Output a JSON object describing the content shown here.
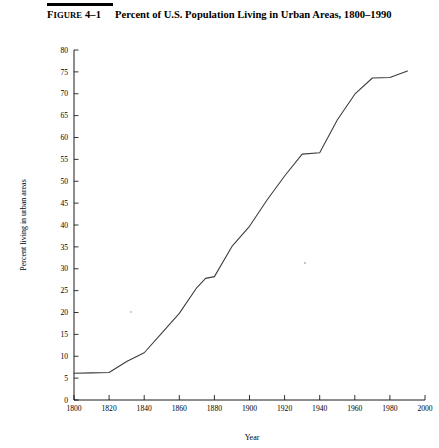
{
  "figure": {
    "label_small_caps": "IGURE",
    "label_lead": "F",
    "label_number": "4–1",
    "title": "Percent of U.S. Population Living in Urban Areas, 1800–1990"
  },
  "chart_data": {
    "type": "line",
    "title": "Percent of U.S. Population Living in Urban Areas, 1800–1990",
    "xlabel": "Year",
    "ylabel": "Percent living in urban areas",
    "xlim": [
      1800,
      2000
    ],
    "ylim": [
      0,
      80
    ],
    "xticks": [
      1800,
      1820,
      1840,
      1860,
      1880,
      1900,
      1920,
      1940,
      1960,
      1980,
      2000
    ],
    "yticks": [
      0,
      5,
      10,
      15,
      20,
      25,
      30,
      35,
      40,
      45,
      50,
      55,
      60,
      65,
      70,
      75,
      80
    ],
    "grid": false,
    "legend": "none",
    "line_color": "#3a3a3a",
    "x": [
      1800,
      1810,
      1820,
      1830,
      1840,
      1850,
      1860,
      1870,
      1875,
      1880,
      1890,
      1900,
      1910,
      1920,
      1930,
      1940,
      1950,
      1960,
      1970,
      1980,
      1990
    ],
    "values": [
      6.1,
      6.2,
      6.3,
      8.8,
      10.8,
      15.3,
      19.8,
      25.7,
      27.8,
      28.2,
      35.1,
      39.7,
      45.7,
      51.2,
      56.2,
      56.5,
      64.0,
      69.9,
      73.6,
      73.7,
      75.2
    ],
    "series": [
      {
        "name": "Percent urban",
        "values": [
          6.1,
          6.2,
          6.3,
          8.8,
          10.8,
          15.3,
          19.8,
          25.7,
          27.8,
          28.2,
          35.1,
          39.7,
          45.7,
          51.2,
          56.2,
          56.5,
          64.0,
          69.9,
          73.6,
          73.7,
          75.2
        ]
      }
    ]
  }
}
